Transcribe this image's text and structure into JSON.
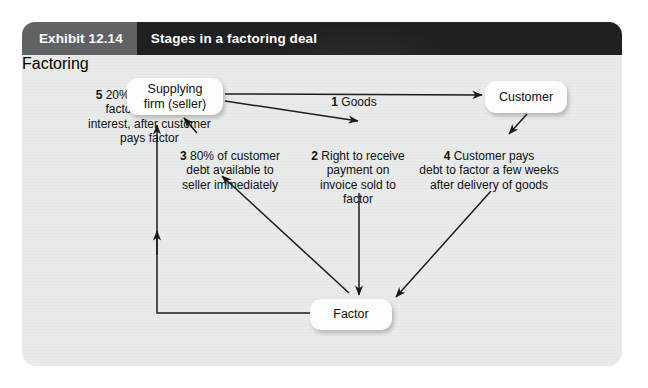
{
  "exhibit": {
    "number_label": "Exhibit 12.14",
    "title": "Stages in a factoring deal"
  },
  "colors": {
    "header_left": "#606264",
    "header_right": "#1e2022",
    "panel_background": "#e9eaea",
    "node_fill": "#fdfdfd",
    "arrow_stroke": "#1b1b1b",
    "text": "#101010"
  },
  "nodes": [
    {
      "id": "supplier",
      "label": "Supplying\nfirm (seller)"
    },
    {
      "id": "customer",
      "label": "Customer"
    },
    {
      "id": "factor",
      "label": "Factor"
    }
  ],
  "steps": [
    {
      "number": "1",
      "text": "Goods",
      "from": "supplier",
      "to": "customer",
      "label_full": "1 Goods"
    },
    {
      "number": "2",
      "text": "Right to receive\npayment on\ninvoice sold to\nfactor",
      "from": "supplier",
      "to": "factor",
      "label_full": "2 Right to receive payment on invoice sold to factor"
    },
    {
      "number": "3",
      "text": "80% of customer\ndebt available to\nseller immediately",
      "from": "factor",
      "to": "supplier",
      "label_full": "3 80% of customer debt available to seller immediately"
    },
    {
      "number": "4",
      "text": "Customer pays\ndebt to factor a few weeks\nafter delivery of goods",
      "from": "customer",
      "to": "factor",
      "label_full": "4 Customer pays debt to factor a few weeks after delivery of goods"
    },
    {
      "number": "5",
      "text": "20% payable, less\nfactor's fees and\ninterest, after customer\npays factor",
      "from": "factor",
      "to": "supplier",
      "label_full": "5 20% payable, less factor's fees and interest, after customer pays factor"
    }
  ],
  "ghost_text": "Factoring"
}
